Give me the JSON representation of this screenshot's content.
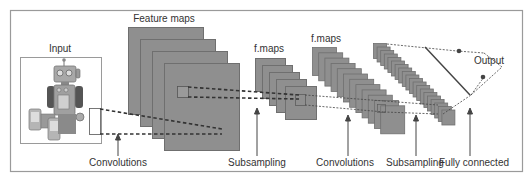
{
  "diagram": {
    "type": "convolutional-neural-network",
    "colors": {
      "frame": "#9a9a9a",
      "map_fill": "#8f8f8f",
      "map_border": "#6f6f6f",
      "dash": "#333333",
      "text": "#333333"
    },
    "top_labels": {
      "input": "Input",
      "feature_maps": "Feature maps",
      "fmaps_1": "f.maps",
      "fmaps_2": "f.maps",
      "output": "Output"
    },
    "bottom_labels": [
      {
        "text": "Convolutions"
      },
      {
        "text": "Subsampling"
      },
      {
        "text": "Convolutions"
      },
      {
        "text": "Subsampling"
      },
      {
        "text": "Fully connected"
      }
    ],
    "layers": [
      {
        "name": "input",
        "label": "Input",
        "count": 1
      },
      {
        "name": "feature-maps",
        "label": "Feature maps",
        "count": 4
      },
      {
        "name": "f-maps-1",
        "label": "f.maps",
        "count": 5
      },
      {
        "name": "f-maps-2",
        "label": "f.maps",
        "count": 12
      },
      {
        "name": "subsampled-maps",
        "label": "",
        "count": 20
      },
      {
        "name": "fully-connected",
        "label": "",
        "count": 1
      },
      {
        "name": "output",
        "label": "Output",
        "count": 2
      }
    ]
  }
}
